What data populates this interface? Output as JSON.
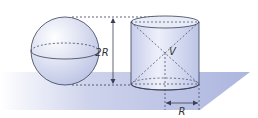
{
  "figure": {
    "labels": {
      "height": "2R",
      "volume": "V",
      "radius": "R"
    },
    "colors": {
      "plane": "#a9b3dc",
      "solid_fill": "#dfe3f4",
      "stroke": "#3a3f55"
    }
  }
}
